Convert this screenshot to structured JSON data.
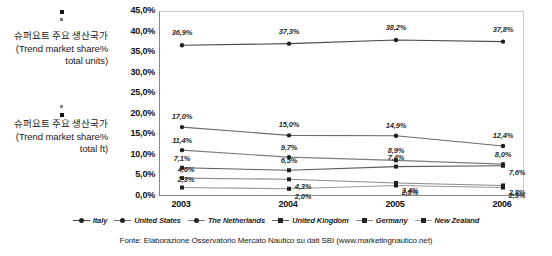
{
  "axis_titles": {
    "units": "슈퍼요트 주요 생산국가(Trend market share% total units)",
    "ft": "슈퍼요트 주요 생산국가 (Trend market share% total ft)"
  },
  "footer": "Fonte: Elaborazione Osservatorio Mercato Nautico su dati SBI (www.marketingnautico.net)",
  "chart_data": {
    "type": "line",
    "title": "",
    "xlabel": "",
    "ylabel": "",
    "categories": [
      "2003",
      "2004",
      "2005",
      "2006"
    ],
    "ylim": [
      0,
      45
    ],
    "ytick_labels": [
      "0,0%",
      "5,0%",
      "10,0%",
      "15,0%",
      "20,0%",
      "25,0%",
      "30,0%",
      "35,0%",
      "40,0%",
      "45,0%"
    ],
    "ytick_values": [
      0,
      5,
      10,
      15,
      20,
      25,
      30,
      35,
      40,
      45
    ],
    "grid": false,
    "legend_position": "bottom",
    "series": [
      {
        "name": "Italy",
        "values": [
          36.9,
          37.3,
          38.2,
          37.8
        ],
        "labels": [
          "36,9%",
          "37,3%",
          "38,2%",
          "37,8%"
        ],
        "color": "#4a4a4a"
      },
      {
        "name": "United States",
        "values": [
          17.0,
          15.0,
          14.9,
          12.4
        ],
        "labels": [
          "17,0%",
          "15,0%",
          "14,9%",
          "12,4%"
        ],
        "color": "#6b6b6b"
      },
      {
        "name": "The Netherlands",
        "values": [
          11.4,
          9.7,
          8.9,
          8.0
        ],
        "labels": [
          "11,4%",
          "9,7%",
          "8,9%",
          "8,0%"
        ],
        "color": "#7d7d7d"
      },
      {
        "name": "United Kingdom",
        "values": [
          7.1,
          6.5,
          7.4,
          7.6
        ],
        "labels": [
          "7,1%",
          "6,5%",
          "7,4%",
          "7,6%"
        ],
        "color": "#5c5c5c"
      },
      {
        "name": "Germany",
        "values": [
          4.6,
          4.3,
          3.4,
          2.8
        ],
        "labels": [
          "4,6%",
          "4,3%",
          "3,4%",
          "2,8%"
        ],
        "color": "#8b8b8b"
      },
      {
        "name": "New Zealand",
        "values": [
          2.3,
          2.0,
          2.8,
          2.3
        ],
        "labels": [
          "2,3%",
          "2,0%",
          "2,8%",
          "2,3%"
        ],
        "color": "#9a9a9a"
      }
    ]
  }
}
